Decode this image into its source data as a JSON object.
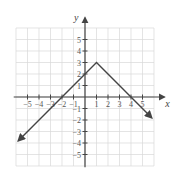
{
  "chart_data": {
    "type": "line",
    "title": "",
    "xlabel": "x",
    "ylabel": "y",
    "xlim": [
      -6,
      6
    ],
    "ylim": [
      -6,
      6
    ],
    "grid": true,
    "x_ticks": [
      -5,
      -4,
      -3,
      -2,
      -1,
      1,
      2,
      3,
      4,
      5
    ],
    "y_ticks": [
      -5,
      -4,
      -3,
      -2,
      -1,
      1,
      2,
      3,
      4,
      5
    ],
    "x_tick_labels": [
      "−5",
      "−4",
      "−3",
      "−2",
      "−1",
      "1",
      "2",
      "3",
      "4",
      "5"
    ],
    "y_tick_labels": [
      "−5",
      "−4",
      "−3",
      "−2",
      "−1",
      "1",
      "2",
      "3",
      "4",
      "5"
    ],
    "series": [
      {
        "name": "f(x)",
        "description": "piecewise linear, y = x + 2 for x ≤ 1, y = -x + 4 for x ≥ 1; vertex at (1, 3); arrows on both ends",
        "points": [
          [
            -5.8,
            -3.8
          ],
          [
            1,
            3
          ],
          [
            5.8,
            -1.8
          ]
        ]
      }
    ]
  },
  "origin_px": [
    85,
    97
  ],
  "unit_px": 11.5
}
